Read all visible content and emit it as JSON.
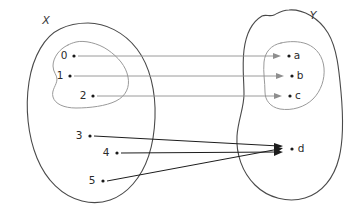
{
  "diagram": {
    "kind": "set-mapping-diagram",
    "background_color": "#ffffff",
    "sets": [
      {
        "id": "X",
        "label": "X",
        "label_x": 46,
        "label_y": 24,
        "outline_color": "#4a4a4a",
        "subset": {
          "id": "X-subset",
          "outline_color": "#9a9a9a"
        }
      },
      {
        "id": "Y",
        "label": "Y",
        "label_x": 313,
        "label_y": 19,
        "outline_color": "#4a4a4a",
        "subset": {
          "id": "Y-subset",
          "outline_color": "#9a9a9a"
        }
      }
    ],
    "domain_elements": [
      {
        "label": "0",
        "label_x": 64,
        "label_y": 59,
        "dot_x": 74,
        "dot_y": 56,
        "set": "X",
        "in_subset": true
      },
      {
        "label": "1",
        "label_x": 60,
        "label_y": 79,
        "dot_x": 70,
        "dot_y": 76,
        "set": "X",
        "in_subset": true
      },
      {
        "label": "2",
        "label_x": 83,
        "label_y": 99,
        "dot_x": 93,
        "dot_y": 96,
        "set": "X",
        "in_subset": true
      },
      {
        "label": "3",
        "label_x": 79,
        "label_y": 139,
        "dot_x": 90,
        "dot_y": 136,
        "set": "X",
        "in_subset": false
      },
      {
        "label": "4",
        "label_x": 106,
        "label_y": 156,
        "dot_x": 117,
        "dot_y": 153,
        "set": "X",
        "in_subset": false
      },
      {
        "label": "5",
        "label_x": 92,
        "label_y": 184,
        "dot_x": 103,
        "dot_y": 181,
        "set": "X",
        "in_subset": false
      }
    ],
    "codomain_elements": [
      {
        "label": "a",
        "label_x": 297,
        "label_y": 59,
        "dot_x": 289,
        "dot_y": 56,
        "set": "Y",
        "in_subset": true
      },
      {
        "label": "b",
        "label_x": 300,
        "label_y": 79,
        "dot_x": 292,
        "dot_y": 76,
        "set": "Y",
        "in_subset": true
      },
      {
        "label": "c",
        "label_x": 298,
        "label_y": 99,
        "dot_x": 290,
        "dot_y": 96,
        "set": "Y",
        "in_subset": true
      },
      {
        "label": "d",
        "label_x": 301,
        "label_y": 152,
        "dot_x": 292,
        "dot_y": 149,
        "set": "Y",
        "in_subset": false
      }
    ],
    "mappings": [
      {
        "from": "0",
        "to": "a",
        "style": "light",
        "x1": 78,
        "y1": 56,
        "x2": 281,
        "y2": 56
      },
      {
        "from": "1",
        "to": "b",
        "style": "light",
        "x1": 74,
        "y1": 76,
        "x2": 284,
        "y2": 76
      },
      {
        "from": "2",
        "to": "c",
        "style": "light",
        "x1": 97,
        "y1": 96,
        "x2": 282,
        "y2": 96
      },
      {
        "from": "3",
        "to": "d",
        "style": "dark",
        "x1": 94,
        "y1": 136,
        "x2": 282,
        "y2": 147
      },
      {
        "from": "4",
        "to": "d",
        "style": "dark",
        "x1": 121,
        "y1": 153,
        "x2": 282,
        "y2": 152
      },
      {
        "from": "5",
        "to": "d",
        "style": "dark",
        "x1": 107,
        "y1": 181,
        "x2": 282,
        "y2": 149
      }
    ]
  }
}
